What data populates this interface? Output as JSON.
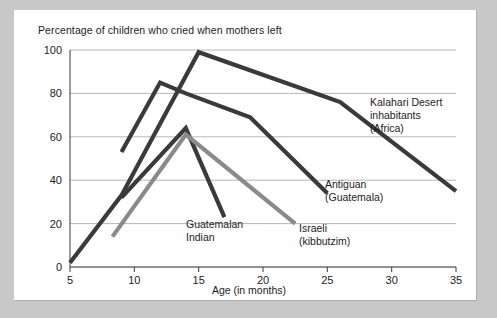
{
  "figure": {
    "title": "Percentage of children who cried when mothers left",
    "background": "#ffffff",
    "page_background": "#c8c8c8"
  },
  "chart_data": {
    "type": "line",
    "title": "Percentage of children who cried when mothers left",
    "xlabel": "Age (in months)",
    "ylabel": "",
    "xlim": [
      5,
      35
    ],
    "ylim": [
      0,
      100
    ],
    "xticks": [
      5,
      10,
      15,
      20,
      25,
      30,
      35
    ],
    "yticks": [
      0,
      20,
      40,
      60,
      80,
      100
    ],
    "grid": "horizontal",
    "legend_position": "inline-annotations",
    "series": [
      {
        "name": "Kalahari Desert inhabitants (Africa)",
        "color": "#3a3a3a",
        "width": 4.2,
        "label_lines": [
          "Kalahari Desert",
          "inhabitants",
          "(Africa)"
        ],
        "points": [
          {
            "x": 5,
            "y": 2
          },
          {
            "x": 9,
            "y": 33
          },
          {
            "x": 15,
            "y": 99
          },
          {
            "x": 26,
            "y": 76
          },
          {
            "x": 35,
            "y": 35
          }
        ]
      },
      {
        "name": "Antiguan (Guatemala)",
        "color": "#3a3a3a",
        "width": 4.2,
        "label_lines": [
          "Antiguan",
          "(Guatemala)"
        ],
        "points": [
          {
            "x": 9,
            "y": 53
          },
          {
            "x": 12,
            "y": 85
          },
          {
            "x": 14,
            "y": 80
          },
          {
            "x": 19,
            "y": 69
          },
          {
            "x": 25,
            "y": 34
          }
        ]
      },
      {
        "name": "Guatemalan Indian",
        "color": "#3a3a3a",
        "width": 4.2,
        "label_lines": [
          "Guatemalan",
          "Indian"
        ],
        "points": [
          {
            "x": 9,
            "y": 32
          },
          {
            "x": 14,
            "y": 64
          },
          {
            "x": 17,
            "y": 23
          }
        ]
      },
      {
        "name": "Israeli (kibbutzim)",
        "color": "#8a8a8a",
        "width": 4.2,
        "label_lines": [
          "Israeli",
          "(kibbutzim)"
        ],
        "points": [
          {
            "x": 8.3,
            "y": 14
          },
          {
            "x": 14,
            "y": 61
          },
          {
            "x": 22.5,
            "y": 20
          }
        ]
      }
    ],
    "annotations": [
      {
        "id": "kalahari",
        "lines": [
          "Kalahari Desert",
          "inhabitants",
          "(Africa)"
        ],
        "x_px": 356,
        "y_px": 96
      },
      {
        "id": "antiguan",
        "lines": [
          "Antiguan",
          "(Guatemala)"
        ],
        "x_px": 311,
        "y_px": 178
      },
      {
        "id": "guatemalan",
        "lines": [
          "Guatemalan",
          "Indian"
        ],
        "x_px": 172,
        "y_px": 218
      },
      {
        "id": "israeli",
        "lines": [
          "Israeli",
          "(kibbutzim)"
        ],
        "x_px": 285,
        "y_px": 222
      }
    ]
  }
}
